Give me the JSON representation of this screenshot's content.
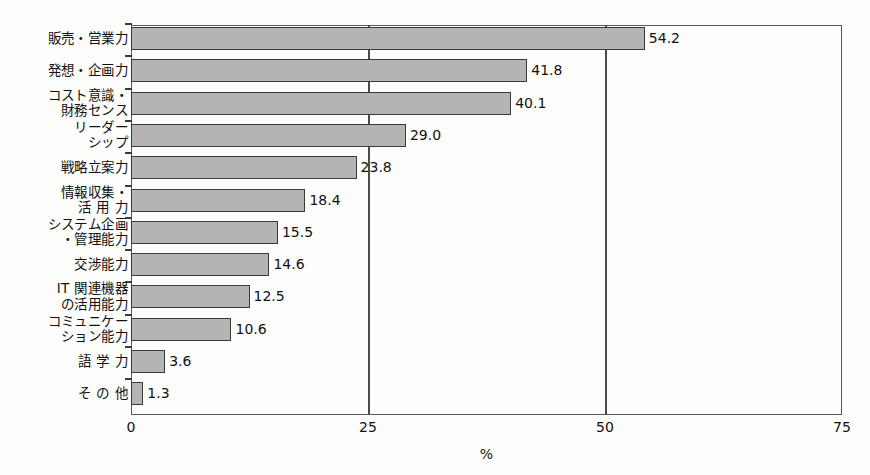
{
  "chart_data": {
    "type": "bar",
    "orientation": "horizontal",
    "title": "",
    "subtitle": "",
    "xlabel": "%",
    "ylabel": "",
    "xlim": [
      0,
      75
    ],
    "xticks": [
      "0",
      "25",
      "50",
      "75"
    ],
    "xtick_values": [
      0,
      25,
      50,
      75
    ],
    "grid": true,
    "gridlines_at": [
      25,
      50
    ],
    "legend": null,
    "bar_fill_color": "#b4b4b4",
    "bar_border_color": "#3a3a3a",
    "background_color": "#fdfdfb",
    "categories": [
      "販売・営業力",
      "発想・企画力",
      "コスト意識・\n財務センス",
      "リーダー\nシップ",
      "戦略立案力",
      "情報収集・\n活 用 力",
      "システム企画\n・管理能力",
      "交渉能力",
      "IT 関連機器\nの活用能力",
      "コミュニケー\nション能力",
      "語 学 力",
      "そ の 他"
    ],
    "values": [
      54.2,
      41.8,
      40.1,
      29.0,
      23.8,
      18.4,
      15.5,
      14.6,
      12.5,
      10.6,
      3.6,
      1.3
    ],
    "value_labels": [
      "54.2",
      "41.8",
      "40.1",
      "29.0",
      "23.8",
      "18.4",
      "15.5",
      "14.6",
      "12.5",
      "10.6",
      "3.6",
      "1.3"
    ]
  }
}
